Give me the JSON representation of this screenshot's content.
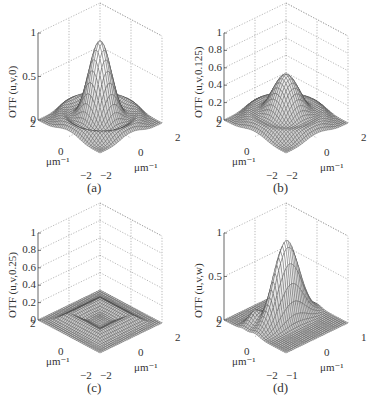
{
  "chart_data": [
    {
      "type": "surface3d",
      "panel": "(a)",
      "zlabel": "OTF (u,v,0)",
      "xlabel": "μm⁻¹",
      "ylabel": "μm⁻¹",
      "zticks": [
        "0",
        "0.5",
        "1"
      ],
      "xticks": [
        "−2",
        "0",
        "2"
      ],
      "yticks": [
        "2",
        "0",
        "−2"
      ],
      "zlim": [
        0,
        1
      ],
      "xlim": [
        -2,
        2
      ],
      "ylim": [
        -2,
        2
      ],
      "peak": 0.93,
      "description": "Central peak ~0.93 at origin with ring of secondary lobes (~0.1) at corners"
    },
    {
      "type": "surface3d",
      "panel": "(b)",
      "zlabel": "OTF (u,v,0.125)",
      "xlabel": "μm⁻¹",
      "ylabel": "μm⁻¹",
      "zticks": [
        "0",
        "0.2",
        "0.4",
        "0.6",
        "0.8",
        "1"
      ],
      "xticks": [
        "−2",
        "0",
        "2"
      ],
      "yticks": [
        "2",
        "0",
        "−2"
      ],
      "zlim": [
        0,
        1
      ],
      "xlim": [
        -2,
        2
      ],
      "ylim": [
        -2,
        2
      ],
      "peak": 0.54,
      "description": "Broader central peak ~0.54 with secondary lobes"
    },
    {
      "type": "surface3d",
      "panel": "(c)",
      "zlabel": "OTF (u,v,0.25)",
      "xlabel": "μm⁻¹",
      "ylabel": "μm⁻¹",
      "zticks": [
        "0",
        "0.2",
        "0.4",
        "0.6",
        "0.8",
        "1"
      ],
      "xticks": [
        "−2",
        "0",
        "2"
      ],
      "yticks": [
        "2",
        "0",
        "−2"
      ],
      "zlim": [
        0,
        1
      ],
      "xlim": [
        -2,
        2
      ],
      "ylim": [
        -2,
        2
      ],
      "peak": 0.1,
      "description": "Nearly flat; low square-ring ridge ~0.1"
    },
    {
      "type": "surface3d",
      "panel": "(d)",
      "zlabel": "OTF (u,v,w)",
      "xlabel": "μm⁻¹",
      "ylabel": "μm⁻¹",
      "zticks": [
        "0",
        "0.5",
        "1"
      ],
      "xticks": [
        "−1",
        "0",
        "1"
      ],
      "yticks": [
        "2",
        "0",
        "−2"
      ],
      "zlim": [
        0,
        1
      ],
      "xlim": [
        -1,
        1
      ],
      "ylim": [
        -2,
        2
      ],
      "peak": 0.93,
      "description": "Sharp narrow ridge peak ~0.93 along one axis"
    }
  ],
  "panels": [
    {
      "caption": "(a)",
      "zlabel": "OTF (u,v,0)",
      "zticks": [
        "1",
        "0.5",
        "0"
      ],
      "xticks": [
        "2",
        "0",
        "−2"
      ],
      "yticks": [
        "−2",
        "0",
        "2"
      ],
      "unit": "μm⁻¹"
    },
    {
      "caption": "(b)",
      "zlabel": "OTF (u,v,0.125)",
      "zticks": [
        "1",
        "0.8",
        "0.6",
        "0.4",
        "0.2",
        "0"
      ],
      "xticks": [
        "2",
        "0",
        "−2"
      ],
      "yticks": [
        "−2",
        "0",
        "2"
      ],
      "unit": "μm⁻¹"
    },
    {
      "caption": "(c)",
      "zlabel": "OTF (u,v,0.25)",
      "zticks": [
        "1",
        "0.8",
        "0.6",
        "0.4",
        "0.2",
        "0"
      ],
      "xticks": [
        "2",
        "0",
        "−2"
      ],
      "yticks": [
        "−2",
        "0",
        "2"
      ],
      "unit": "μm⁻¹"
    },
    {
      "caption": "(d)",
      "zlabel": "OTF (u,v,w)",
      "zticks": [
        "1",
        "0.5",
        "0"
      ],
      "xticks": [
        "2",
        "0",
        "−2"
      ],
      "yticks": [
        "−1",
        "0",
        "1"
      ],
      "unit": "μm⁻¹"
    }
  ]
}
